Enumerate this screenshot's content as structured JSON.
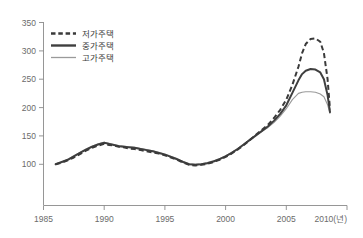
{
  "chart_data": {
    "type": "line",
    "title": "",
    "xlabel": "",
    "ylabel": "",
    "x_unit": "2010(년)",
    "xlim": [
      1985,
      2010
    ],
    "ylim": [
      75,
      360
    ],
    "grid": false,
    "legend_position": "top-left",
    "xticks": [
      "1985",
      "1990",
      "1995",
      "2000",
      "2005",
      "2010(년)"
    ],
    "xtick_values": [
      1985,
      1990,
      1995,
      2000,
      2005,
      2010
    ],
    "yticks": [
      "100",
      "150",
      "200",
      "250",
      "300",
      "350"
    ],
    "ytick_values": [
      100,
      150,
      200,
      250,
      300,
      350
    ],
    "x": [
      1986.0,
      1986.5,
      1987.0,
      1987.5,
      1988.0,
      1988.5,
      1989.0,
      1989.5,
      1990.0,
      1990.4,
      1990.8,
      1991.2,
      1991.6,
      1992.0,
      1992.5,
      1993.0,
      1993.5,
      1994.0,
      1994.5,
      1995.0,
      1995.5,
      1996.0,
      1996.5,
      1997.0,
      1997.5,
      1998.0,
      1998.5,
      1999.0,
      1999.5,
      2000.0,
      2000.5,
      2001.0,
      2001.5,
      2002.0,
      2002.5,
      2003.0,
      2003.5,
      2004.0,
      2004.5,
      2005.0,
      2005.5,
      2006.0,
      2006.3,
      2006.6,
      2007.0,
      2007.4,
      2007.8,
      2008.1,
      2008.4,
      2008.6
    ],
    "series": [
      {
        "name": "저가주택",
        "style": "dashed",
        "color": "#3a3a3a",
        "values": [
          100,
          103,
          107,
          112,
          118,
          124,
          129,
          133,
          136,
          134,
          133,
          131,
          130,
          128,
          127,
          125,
          123,
          121,
          119,
          116,
          112,
          108,
          103,
          99,
          98,
          99,
          101,
          104,
          108,
          113,
          119,
          126,
          134,
          143,
          152,
          161,
          170,
          182,
          196,
          214,
          240,
          272,
          296,
          312,
          321,
          322,
          316,
          296,
          250,
          197
        ]
      },
      {
        "name": "중가주택",
        "style": "solid",
        "color": "#3f3f3f",
        "values": [
          100,
          104,
          108,
          114,
          120,
          126,
          131,
          135,
          138,
          136,
          134,
          132,
          131,
          130,
          129,
          127,
          125,
          123,
          120,
          117,
          113,
          109,
          104,
          100,
          99,
          100,
          102,
          105,
          109,
          114,
          120,
          127,
          135,
          143,
          151,
          159,
          167,
          177,
          189,
          204,
          226,
          248,
          259,
          265,
          268,
          267,
          262,
          250,
          222,
          192
        ]
      },
      {
        "name": "고가주택",
        "style": "solid-thin",
        "color": "#9a9a9a",
        "values": [
          100,
          104,
          109,
          115,
          121,
          127,
          132,
          136,
          139,
          137,
          135,
          133,
          132,
          131,
          130,
          128,
          126,
          124,
          121,
          118,
          114,
          110,
          105,
          101,
          100,
          101,
          103,
          106,
          110,
          115,
          121,
          128,
          136,
          144,
          151,
          158,
          165,
          174,
          185,
          198,
          214,
          225,
          227,
          228,
          228,
          227,
          224,
          219,
          205,
          190
        ]
      }
    ]
  },
  "legend": {
    "items": [
      {
        "label": "저가주택"
      },
      {
        "label": "중가주택"
      },
      {
        "label": "고가주택"
      }
    ]
  }
}
